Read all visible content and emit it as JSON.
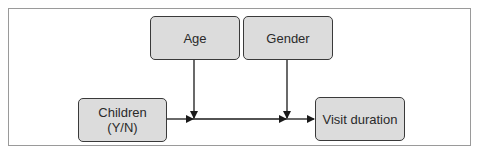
{
  "diagram": {
    "type": "causal-diagram",
    "nodes": {
      "age": {
        "label": "Age"
      },
      "gender": {
        "label": "Gender"
      },
      "children": {
        "line1": "Children",
        "line2": "(Y/N)"
      },
      "visit_duration": {
        "label": "Visit duration"
      }
    },
    "edges": [
      {
        "from": "Children (Y/N)",
        "to": "Visit duration"
      },
      {
        "from": "Age",
        "to": "Children → Visit duration edge (moderator)"
      },
      {
        "from": "Gender",
        "to": "Children → Visit duration edge (moderator)"
      }
    ],
    "colors": {
      "node_fill": "#dcdcdc",
      "node_border": "#3a3a3a",
      "edge": "#1a1a1a",
      "frame_border": "#9a9a9a"
    }
  }
}
